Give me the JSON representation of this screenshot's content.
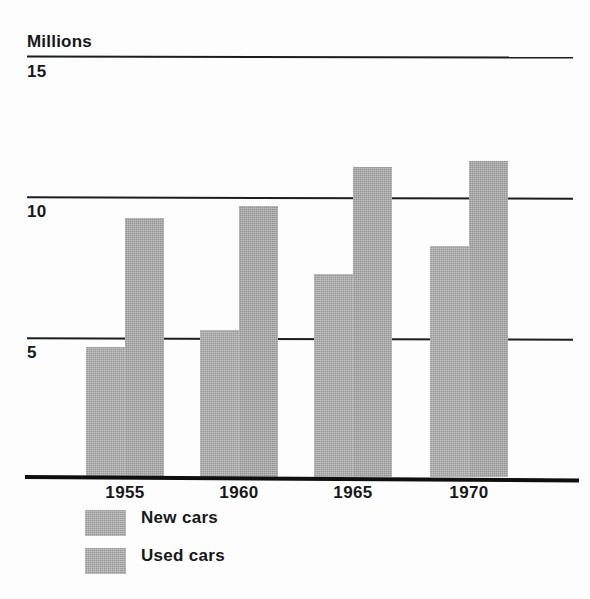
{
  "chart_data": {
    "type": "bar",
    "title": "",
    "subtitle": "",
    "ylabel": "Millions",
    "xlabel": "",
    "categories": [
      "1955",
      "1960",
      "1965",
      "1970"
    ],
    "series": [
      {
        "name": "New cars",
        "values": [
          4.6,
          5.2,
          7.2,
          8.2
        ]
      },
      {
        "name": "Used cars",
        "values": [
          9.2,
          9.6,
          11.0,
          11.2
        ]
      }
    ],
    "ylim": [
      0,
      16
    ],
    "yticks": [
      5,
      10,
      15
    ],
    "ytick_labels": [
      "5",
      "10",
      "15"
    ],
    "grid": true,
    "legend_position": "bottom-left",
    "bar_color": "#a9a9a9",
    "axis_color": "#16181a"
  },
  "axis": {
    "unit_label": "Millions",
    "tick_15": "15",
    "tick_10": "10",
    "tick_5": "5"
  },
  "categories": {
    "c0": "1955",
    "c1": "1960",
    "c2": "1965",
    "c3": "1970"
  },
  "legend": {
    "new_cars": "New cars",
    "used_cars": "Used cars"
  }
}
